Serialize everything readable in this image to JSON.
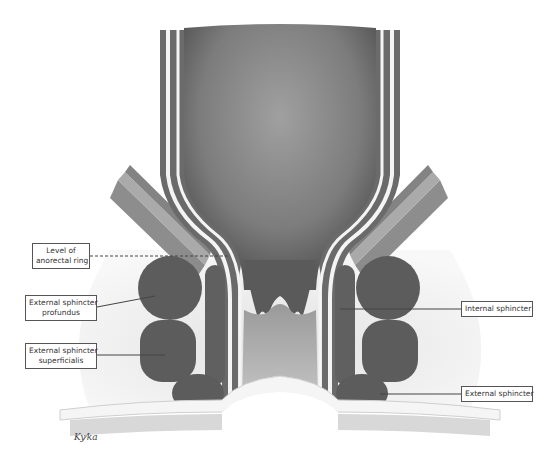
{
  "figure": {
    "signature": "artist signature"
  },
  "labels": {
    "anorectal_ring": {
      "line1": "Level of",
      "line2": "anorectal ring"
    },
    "ext_profundus": {
      "line1": "External sphincter",
      "line2": "profundus"
    },
    "ext_superficialis": {
      "line1": "External sphincter",
      "line2": "superficialis"
    },
    "internal_sphincter": {
      "line1": "Internal sphincter"
    },
    "external_sphincter": {
      "line1": "External sphincter"
    }
  },
  "colors": {
    "background": "#ffffff",
    "muscle_dark": "#5e5e5e",
    "lumen": "#8a8a8a",
    "tissue_light": "#e6e6e6",
    "mucosa_white": "#f7f7f7",
    "label_border": "#555555"
  }
}
